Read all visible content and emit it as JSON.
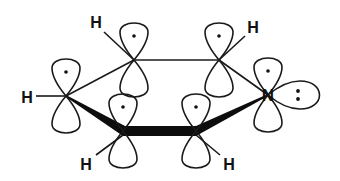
{
  "diagram": {
    "ink_color": "#1a1a1a",
    "background": "#ffffff",
    "atoms": [
      {
        "id": "c2",
        "element": "C",
        "x": 134,
        "y": 60,
        "p_orbital": true,
        "electron": "·"
      },
      {
        "id": "c3",
        "element": "C",
        "x": 219,
        "y": 60,
        "p_orbital": true,
        "electron": "·"
      },
      {
        "id": "c4",
        "element": "C",
        "x": 66,
        "y": 96,
        "p_orbital": true,
        "electron": "·"
      },
      {
        "id": "c5",
        "element": "C",
        "x": 123,
        "y": 131,
        "p_orbital": true,
        "electron": "·"
      },
      {
        "id": "c6",
        "element": "C",
        "x": 196,
        "y": 131,
        "p_orbital": true,
        "electron": "·"
      },
      {
        "id": "n1",
        "element": "N",
        "x": 268,
        "y": 95,
        "p_orbital": true,
        "electron": "·",
        "lone_pair": ":"
      }
    ],
    "hydrogens": [
      {
        "label": "H",
        "x": 96,
        "y": 21,
        "bonded_to": "c2"
      },
      {
        "label": "H",
        "x": 253,
        "y": 27,
        "bonded_to": "c3"
      },
      {
        "label": "H",
        "x": 27,
        "y": 97,
        "bonded_to": "c4"
      },
      {
        "label": "H",
        "x": 86,
        "y": 164,
        "bonded_to": "c5"
      },
      {
        "label": "H",
        "x": 229,
        "y": 164,
        "bonded_to": "c6"
      }
    ],
    "labels": {
      "h": "H",
      "n": "N",
      "lone_pair": ":",
      "electron": "·"
    }
  }
}
